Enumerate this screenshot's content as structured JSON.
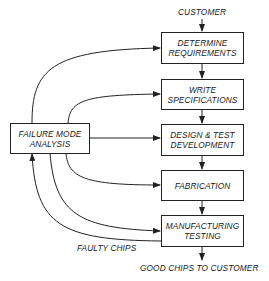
{
  "diagram": {
    "input_label": "CUSTOMER",
    "process_steps": [
      {
        "id": "determine",
        "label": "DETERMINE\nREQUIREMENTS"
      },
      {
        "id": "write",
        "label": "WRITE\nSPECIFICATIONS"
      },
      {
        "id": "design",
        "label": "DESIGN & TEST\nDEVELOPMENT"
      },
      {
        "id": "fabrication",
        "label": "FABRICATION"
      },
      {
        "id": "testing",
        "label": "MANUFACTURING\nTESTING"
      }
    ],
    "analysis_box": {
      "label": "FAILURE MODE\nANALYSIS"
    },
    "feedback_label": "FAULTY CHIPS",
    "output_label": "GOOD CHIPS TO CUSTOMER",
    "colors": {
      "line": "#222222",
      "background": "#ffffff"
    }
  }
}
